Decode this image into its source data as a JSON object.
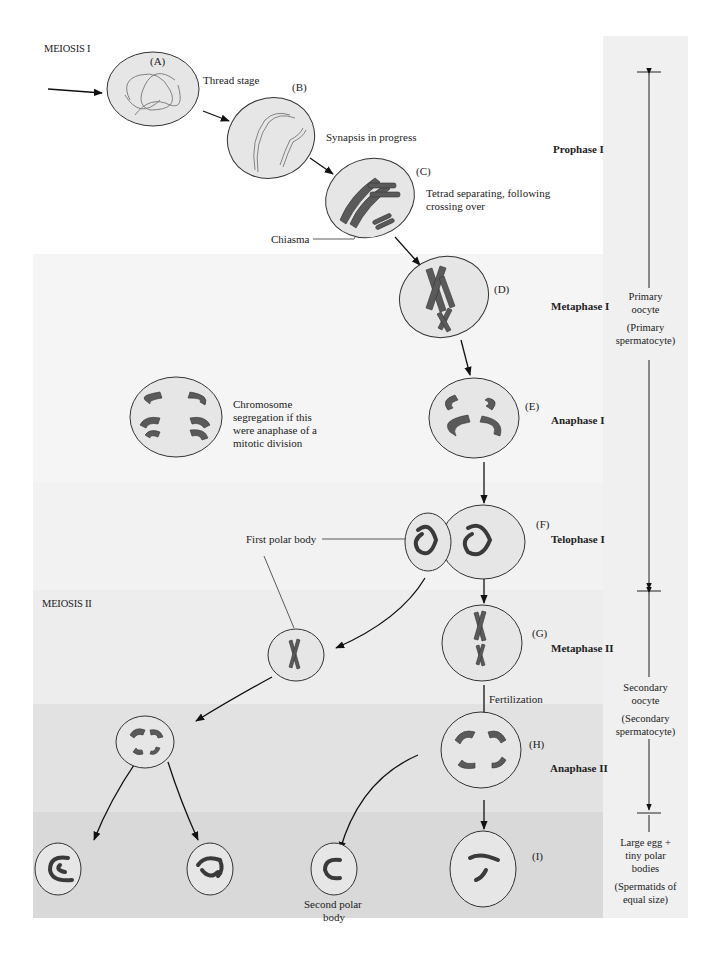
{
  "sections": {
    "meiosis1": "MEIOSIS I",
    "meiosis2": "MEIOSIS II"
  },
  "stages": [
    {
      "id": "A",
      "letter": "(A)",
      "description": "Thread stage"
    },
    {
      "id": "B",
      "letter": "(B)",
      "description": "Synapsis in progress"
    },
    {
      "id": "C",
      "letter": "(C)",
      "description_line1": "Tetrad separating, following",
      "description_line2": "crossing over"
    },
    {
      "id": "D",
      "letter": "(D)"
    },
    {
      "id": "E",
      "letter": "(E)"
    },
    {
      "id": "F",
      "letter": "(F)"
    },
    {
      "id": "G",
      "letter": "(G)"
    },
    {
      "id": "H",
      "letter": "(H)"
    },
    {
      "id": "I",
      "letter": "(I)"
    }
  ],
  "phases": {
    "prophase1": "Prophase I",
    "metaphase1": "Metaphase I",
    "anaphase1": "Anaphase I",
    "telophase1": "Telophase I",
    "metaphase2": "Metaphase II",
    "anaphase2": "Anaphase II"
  },
  "annotations": {
    "chiasma": "Chiasma",
    "mitotic_compare": [
      "Chromosome",
      "segregation if this",
      "were anaphase of a",
      "mitotic division"
    ],
    "first_polar_body": "First polar body",
    "fertilization": "Fertilization",
    "second_polar_body": [
      "Second polar",
      "body"
    ]
  },
  "right_column": {
    "primary": [
      "Primary",
      "oocyte"
    ],
    "primary_sperm": [
      "(Primary",
      "spermatocyte)"
    ],
    "secondary": [
      "Secondary",
      "oocyte"
    ],
    "secondary_sperm": [
      "(Secondary",
      "spermatocyte)"
    ],
    "final": [
      "Large egg +",
      "tiny polar",
      "bodies"
    ],
    "final_sperm": [
      "(Spermatids of",
      "equal size)"
    ]
  },
  "colors": {
    "cell_fill": "#e6e6e6",
    "chromosome": "#555555",
    "band_light": "#f4f4f4",
    "band_mid": "#ececec",
    "band_dark": "#dcdcdc",
    "right_col": "#efefef"
  }
}
